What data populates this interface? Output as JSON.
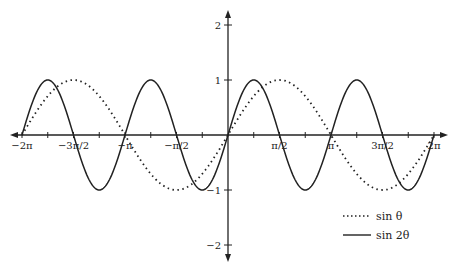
{
  "chart_data": {
    "type": "line",
    "title": "",
    "xlabel": "",
    "ylabel": "",
    "xlim": [
      -6.2832,
      6.2832
    ],
    "ylim": [
      -2,
      2
    ],
    "grid": false,
    "legend_position": "lower right",
    "x_ticks": [
      {
        "value": -6.2832,
        "label": "−2π"
      },
      {
        "value": -4.7124,
        "label": "−3π/2"
      },
      {
        "value": -3.1416,
        "label": "−π"
      },
      {
        "value": -1.5708,
        "label": "−π/2"
      },
      {
        "value": 1.5708,
        "label": "π/2"
      },
      {
        "value": 3.1416,
        "label": "π"
      },
      {
        "value": 4.7124,
        "label": "3π/2"
      },
      {
        "value": 6.2832,
        "label": "2π"
      }
    ],
    "y_ticks": [
      {
        "value": 2,
        "label": "2"
      },
      {
        "value": 1,
        "label": "1"
      },
      {
        "value": -1,
        "label": "−1"
      },
      {
        "value": -2,
        "label": "−2"
      }
    ],
    "series": [
      {
        "name": "sin θ",
        "function": "sin(x)",
        "style": "dotted",
        "x": [
          -6.2832,
          -4.7124,
          -3.1416,
          -1.5708,
          0,
          1.5708,
          3.1416,
          4.7124,
          6.2832
        ],
        "values": [
          0,
          1,
          0,
          -1,
          0,
          1,
          0,
          -1,
          0
        ]
      },
      {
        "name": "sin 2θ",
        "function": "sin(2x)",
        "style": "solid",
        "x": [
          -6.2832,
          -5.4978,
          -4.7124,
          -3.927,
          -3.1416,
          -2.3562,
          -1.5708,
          -0.7854,
          0,
          0.7854,
          1.5708,
          2.3562,
          3.1416,
          3.927,
          4.7124,
          5.4978,
          6.2832
        ],
        "values": [
          0,
          1,
          0,
          -1,
          0,
          1,
          0,
          -1,
          0,
          1,
          0,
          -1,
          0,
          1,
          0,
          -1,
          0
        ]
      }
    ]
  },
  "legend": {
    "items": [
      {
        "label": "sin θ",
        "style": "dotted"
      },
      {
        "label": "sin 2θ",
        "style": "solid"
      }
    ]
  }
}
